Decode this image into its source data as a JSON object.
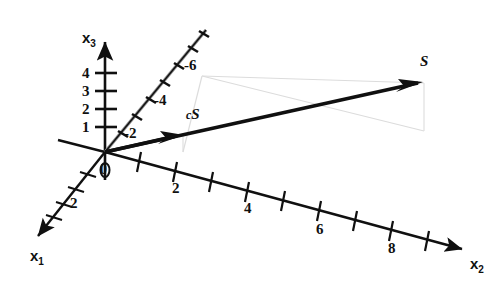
{
  "figure": {
    "type": "3d-axes-vector-diagram",
    "background_color": "#ffffff",
    "ink_color": "#101010",
    "construction_color": "#d8d8d8"
  },
  "axes": {
    "x1": {
      "label": "x",
      "subscript": "1",
      "direction": "down-left",
      "tick_labels": [
        "2"
      ]
    },
    "x2": {
      "label": "x",
      "subscript": "2",
      "direction": "down-right",
      "tick_labels": [
        "2",
        "4",
        "6",
        "8"
      ]
    },
    "x3": {
      "label": "x",
      "subscript": "3",
      "direction": "up",
      "tick_labels": [
        "1",
        "2",
        "3",
        "4"
      ]
    },
    "negative_x2": {
      "direction": "up-right",
      "tick_labels": [
        "-2",
        "-4",
        "-6"
      ]
    },
    "origin_label": "0"
  },
  "vectors": [
    {
      "name": "S",
      "label": "S",
      "scalar_prefix": "",
      "description": "long bold arrow to upper right"
    },
    {
      "name": "cS",
      "label": "S",
      "scalar_prefix": "c",
      "description": "short bold arrow along same direction"
    }
  ],
  "labels": {
    "x3_ticks": [
      {
        "text": "4",
        "x": 82,
        "y": 68
      },
      {
        "text": "3",
        "x": 82,
        "y": 85
      },
      {
        "text": "2",
        "x": 82,
        "y": 103
      },
      {
        "text": "1",
        "x": 82,
        "y": 122
      }
    ],
    "neg_x2_ticks": [
      {
        "text": "-2",
        "x": 126,
        "y": 126
      },
      {
        "text": "-4",
        "x": 156,
        "y": 95
      },
      {
        "text": "-6",
        "x": 186,
        "y": 60
      }
    ],
    "x2_ticks": [
      {
        "text": "2",
        "x": 174,
        "y": 183
      },
      {
        "text": "4",
        "x": 246,
        "y": 203
      },
      {
        "text": "6",
        "x": 318,
        "y": 224
      },
      {
        "text": "8",
        "x": 390,
        "y": 243
      }
    ],
    "x1_ticks": [
      {
        "text": "2",
        "x": 72,
        "y": 197
      }
    ]
  }
}
